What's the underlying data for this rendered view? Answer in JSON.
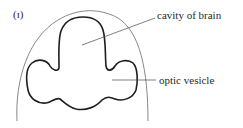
{
  "figure": {
    "panel_label": "(ɪ)",
    "structures": {
      "outer": "embryo head outline",
      "inner": "brain with optic vesicles"
    },
    "callouts": [
      {
        "id": "cavity-of-brain",
        "text": "cavity of brain"
      },
      {
        "id": "optic-vesicle",
        "text": "optic vesicle"
      }
    ]
  }
}
